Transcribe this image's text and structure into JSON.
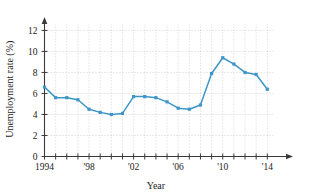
{
  "chart_data": {
    "type": "line",
    "title": "",
    "xlabel": "Year",
    "ylabel": "Unemployment rate (%)",
    "xlim": [
      1994,
      2014
    ],
    "ylim": [
      0,
      12.8
    ],
    "grid": true,
    "legend": false,
    "series_color": "#3d96c8",
    "x": [
      1994,
      1995,
      1996,
      1997,
      1998,
      1999,
      2000,
      2001,
      2002,
      2003,
      2004,
      2005,
      2006,
      2007,
      2008,
      2009,
      2010,
      2011,
      2012,
      2013,
      2014
    ],
    "values": [
      6.6,
      5.6,
      5.6,
      5.4,
      4.5,
      4.2,
      4.0,
      4.1,
      5.7,
      5.7,
      5.6,
      5.2,
      4.6,
      4.5,
      4.9,
      7.9,
      9.4,
      8.8,
      8.0,
      7.8,
      6.4
    ],
    "y_ticks": [
      0,
      2,
      4,
      6,
      8,
      10,
      12
    ],
    "y_tick_labels": [
      "0",
      "2",
      "4",
      "6",
      "8",
      "10",
      "12"
    ],
    "x_ticks": [
      1994,
      1995,
      1996,
      1997,
      1998,
      1999,
      2000,
      2001,
      2002,
      2003,
      2004,
      2005,
      2006,
      2007,
      2008,
      2009,
      2010,
      2011,
      2012,
      2013,
      2014
    ],
    "x_tick_labels": [
      {
        "value": 1994,
        "label": "1994"
      },
      {
        "value": 1998,
        "label": "'98"
      },
      {
        "value": 2002,
        "label": "'02"
      },
      {
        "value": 2006,
        "label": "'06"
      },
      {
        "value": 2010,
        "label": "'10"
      },
      {
        "value": 2014,
        "label": "'14"
      }
    ]
  }
}
